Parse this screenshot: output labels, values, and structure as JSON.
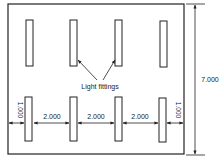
{
  "diagram": {
    "type": "lighting-layout-plan",
    "room": {
      "height_label": "7.000"
    },
    "callout": {
      "label": "Light fittings"
    },
    "dimensions": {
      "left_end": "1.000",
      "spacing_1": "2.000",
      "spacing_2": "2.000",
      "spacing_3": "2.000",
      "right_end": "1.000"
    },
    "fittings": {
      "rows": 2,
      "per_row": 4
    },
    "colors": {
      "line": "#222222",
      "background": "#ffffff"
    }
  }
}
